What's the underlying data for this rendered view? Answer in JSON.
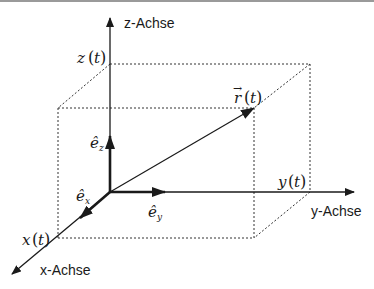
{
  "diagram": {
    "type": "3d-coordinate-system",
    "colors": {
      "line": "#1a1a1a",
      "dotted": "#333333",
      "topline": "#9a9a9a"
    },
    "axes": {
      "z": {
        "label": "z-Achse"
      },
      "y": {
        "label": "y-Achse"
      },
      "x": {
        "label": "x-Achse"
      }
    },
    "unit_vectors": {
      "ez": {
        "symbol": "ê",
        "sub": "z"
      },
      "ey": {
        "symbol": "ê",
        "sub": "y"
      },
      "ex": {
        "symbol": "ê",
        "sub": "x"
      }
    },
    "components": {
      "z": {
        "var": "z",
        "arg": "t"
      },
      "y": {
        "var": "y",
        "arg": "t"
      },
      "x": {
        "var": "x",
        "arg": "t"
      }
    },
    "position_vector": {
      "var": "r",
      "arrow": "→",
      "arg": "t"
    },
    "parens": {
      "open": "(",
      "close": ")"
    }
  }
}
